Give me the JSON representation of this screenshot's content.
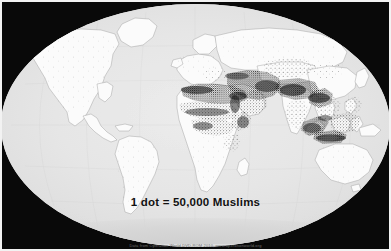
{
  "map": {
    "title": "World Muslim Population Distribution",
    "projection": "elliptical-winkel",
    "legend_text": "1 dot = 50,000 Muslims",
    "credit_text": "Data from Operation World DVD-ROM 2010, www.operationworld.org",
    "dot_unit_label": "1 dot",
    "dot_unit_value": "50,000",
    "dot_unit_subject": "Muslims",
    "colors": {
      "letterbox": "#090909",
      "ocean": "#e7e7e7",
      "land": "#fbfbfb",
      "border_line": "#9a9a9a",
      "dot": "#1c1c1c",
      "page_frame": "#f2f2f2",
      "legend_text": "#111111",
      "credit_text": "#6e6e6e"
    },
    "regions": [
      {
        "name": "North America",
        "density": "very-low"
      },
      {
        "name": "South America",
        "density": "very-low"
      },
      {
        "name": "Europe",
        "density": "low"
      },
      {
        "name": "Russia",
        "density": "low"
      },
      {
        "name": "North Africa",
        "density": "very-high"
      },
      {
        "name": "West Africa",
        "density": "high"
      },
      {
        "name": "Horn of Africa",
        "density": "high"
      },
      {
        "name": "Middle East",
        "density": "very-high"
      },
      {
        "name": "Central Asia",
        "density": "medium"
      },
      {
        "name": "South Asia",
        "density": "very-high"
      },
      {
        "name": "Southeast Asia",
        "density": "very-high"
      },
      {
        "name": "Indonesia",
        "density": "very-high"
      },
      {
        "name": "Australia",
        "density": "very-low"
      },
      {
        "name": "Antarctica",
        "density": "none"
      }
    ]
  }
}
